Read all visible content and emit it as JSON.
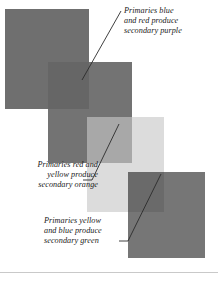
{
  "figure": {
    "background_color": "#ffffff"
  },
  "swatches": [
    {
      "name": "blue-primary-top",
      "color_role": "primary blue",
      "fill": "#6f6f6f",
      "x": 5,
      "y": 9,
      "width": 84,
      "height": 100
    },
    {
      "name": "red-primary",
      "color_role": "primary red",
      "fill": "#737373",
      "x": 48,
      "y": 62,
      "width": 84,
      "height": 101
    },
    {
      "name": "purple-secondary",
      "color_role": "secondary purple",
      "fill": "#666666",
      "x": 48,
      "y": 62,
      "width": 41,
      "height": 47
    },
    {
      "name": "yellow-primary",
      "color_role": "primary yellow",
      "fill": "#dcdcdc",
      "x": 87,
      "y": 117,
      "width": 77,
      "height": 95
    },
    {
      "name": "orange-secondary",
      "color_role": "secondary orange",
      "fill": "#a8a8a8",
      "x": 87,
      "y": 117,
      "width": 45,
      "height": 46
    },
    {
      "name": "blue-primary-bottom",
      "color_role": "primary blue",
      "fill": "#767676",
      "x": 128,
      "y": 172,
      "width": 77,
      "height": 86
    },
    {
      "name": "green-secondary",
      "color_role": "secondary green",
      "fill": "#6a6a6a",
      "x": 128,
      "y": 172,
      "width": 36,
      "height": 40
    }
  ],
  "captions": {
    "purple": "Primaries blue\nand red produce\nsecondary purple",
    "orange": "Primaries red and\nyellow produce\nsecondary orange",
    "green": "Primaries yellow\nand blue produce\nsecondary green"
  },
  "leaders": {
    "stroke": "#2b2b2b",
    "purple": {
      "x1": 121,
      "y1": 11,
      "x2": 82,
      "y2": 80
    },
    "orange": {
      "x1": 119,
      "y1": 124,
      "x2": 92,
      "y2": 180,
      "x3": 83,
      "y3": 180
    },
    "green": {
      "x1": 161,
      "y1": 174,
      "x2": 128,
      "y2": 241,
      "x3": 119,
      "y3": 241
    }
  },
  "rule": {
    "name": "bottom-rule",
    "color": "#c9c9c9"
  }
}
